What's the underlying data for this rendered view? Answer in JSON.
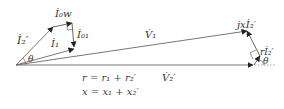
{
  "diagram": {
    "colors": {
      "line": "#555555",
      "arrow": "#222222",
      "text": "#333333"
    },
    "labels": {
      "i2p": "İ₂′",
      "i0w": "İ₀w",
      "i01": "İ₀₁",
      "i1": "İ₁",
      "v1": "V̇₁",
      "v2p": "V̇₂′",
      "jxi2": "jxİ₂′",
      "ri2": "rİ₂′",
      "theta_left": "θ",
      "theta_right": "θ"
    },
    "equations": {
      "r": "r = r₁ + r₂′",
      "x": "x = x₁ + x₂′"
    }
  }
}
